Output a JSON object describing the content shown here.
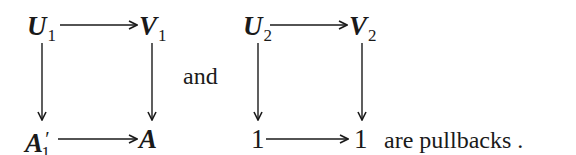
{
  "diagram_1": {
    "top_left": {
      "symbol": "U",
      "subscript": "1"
    },
    "top_right": {
      "symbol": "V",
      "subscript": "1"
    },
    "bottom_left": {
      "symbol": "A",
      "prime": "′",
      "subscript": "1"
    },
    "bottom_right": {
      "symbol": "A"
    }
  },
  "connector": "and",
  "diagram_2": {
    "top_left": {
      "symbol": "U",
      "subscript": "2"
    },
    "top_right": {
      "symbol": "V",
      "subscript": "2"
    },
    "bottom_left": {
      "symbol": "1"
    },
    "bottom_right": {
      "symbol": "1"
    }
  },
  "trailing_text": "are pullbacks ."
}
